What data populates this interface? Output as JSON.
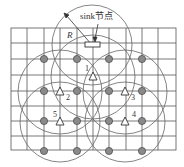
{
  "diagram": {
    "sink_label": "sink节点",
    "radius_label": "R",
    "sensor_labels": [
      "1",
      "2",
      "3",
      "4",
      "5"
    ],
    "grid": {
      "x0": 11,
      "y0": 28,
      "x1": 176,
      "y1": 150,
      "cols": 10,
      "rows": 8
    },
    "colors": {
      "grid": "#555555",
      "circle": "#666666",
      "node_fill": "#8a8a8a",
      "node_stroke": "#444444",
      "triangle": "#333333"
    },
    "gray_nodes": [
      [
        44,
        59
      ],
      [
        77,
        59
      ],
      [
        109,
        59
      ],
      [
        142,
        59
      ],
      [
        44,
        91
      ],
      [
        77,
        91
      ],
      [
        109,
        91
      ],
      [
        142,
        91
      ],
      [
        44,
        121
      ],
      [
        77,
        121
      ],
      [
        109,
        121
      ],
      [
        142,
        121
      ],
      [
        44,
        151
      ],
      [
        77,
        151
      ],
      [
        109,
        151
      ],
      [
        142,
        151
      ]
    ],
    "sensors": [
      {
        "id": "1",
        "x": 93,
        "y": 77
      },
      {
        "id": "2",
        "x": 60,
        "y": 92
      },
      {
        "id": "3",
        "x": 125,
        "y": 92
      },
      {
        "id": "4",
        "x": 125,
        "y": 122
      },
      {
        "id": "5",
        "x": 60,
        "y": 122
      }
    ]
  }
}
